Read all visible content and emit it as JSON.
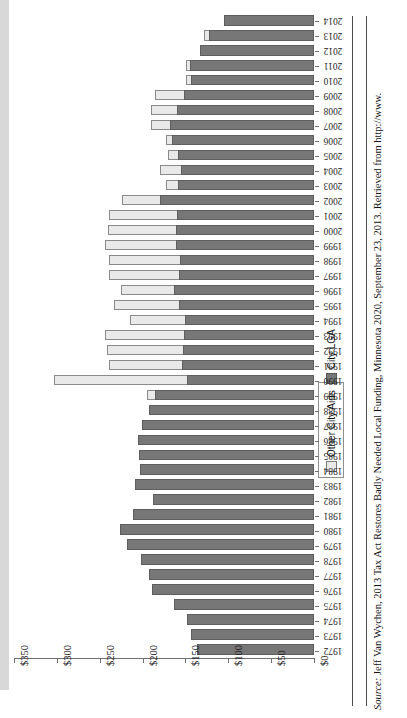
{
  "chart_data": {
    "type": "bar",
    "subtype": "stacked-horizontal",
    "title": "",
    "xlabel": "",
    "ylabel": "",
    "orientation": "horizontal-reversed",
    "xlim": [
      0,
      350
    ],
    "x_tick_labels": [
      "$350",
      "$300",
      "$250",
      "$200",
      "$150",
      "$100",
      "$50",
      "$0"
    ],
    "x_tick_values": [
      350,
      300,
      250,
      200,
      150,
      100,
      50,
      0
    ],
    "grid": false,
    "legend_position": "right-middle",
    "categories": [
      "2014",
      "2013",
      "2012",
      "2011",
      "2010",
      "2009",
      "2008",
      "2007",
      "2006",
      "2005",
      "2004",
      "2003",
      "2002",
      "2001",
      "2000",
      "1999",
      "1998",
      "1997",
      "1996",
      "1995",
      "1994",
      "1993",
      "1992",
      "1991",
      "1990",
      "1989",
      "1988",
      "1987",
      "1986",
      "1985",
      "1984",
      "1983",
      "1982",
      "1981",
      "1980",
      "1979",
      "1978",
      "1977",
      "1976",
      "1975",
      "1974",
      "1973",
      "1972"
    ],
    "series": [
      {
        "name": "City LGA",
        "color": "#777777",
        "values": [
          105,
          123,
          133,
          145,
          143,
          152,
          160,
          168,
          166,
          159,
          155,
          159,
          180,
          160,
          161,
          161,
          156,
          157,
          163,
          158,
          150,
          152,
          153,
          154,
          148,
          186,
          192,
          201,
          205,
          204,
          203,
          209,
          188,
          211,
          226,
          218,
          202,
          193,
          189,
          163,
          148,
          143,
          137
        ]
      },
      {
        "name": "Other City Aids",
        "color": "#e9e9e9",
        "values": [
          0,
          6,
          0,
          5,
          8,
          35,
          31,
          23,
          8,
          12,
          26,
          15,
          45,
          80,
          81,
          84,
          84,
          83,
          63,
          77,
          66,
          93,
          90,
          86,
          157,
          10,
          0,
          0,
          0,
          0,
          0,
          0,
          0,
          0,
          0,
          0,
          0,
          0,
          0,
          0,
          0,
          0,
          0
        ]
      }
    ]
  },
  "legend": {
    "items": [
      {
        "label": "Other City Aids",
        "swatch": "other"
      },
      {
        "label": "City LGA",
        "swatch": "lga"
      }
    ]
  },
  "source": {
    "prefix": "Source:",
    "text": " Jeff Van Wychen, 2013 Tax Act Restores Badly Needed Local Funding, Minnesota 2020, September 23, 2013. Retrieved from http://www."
  }
}
